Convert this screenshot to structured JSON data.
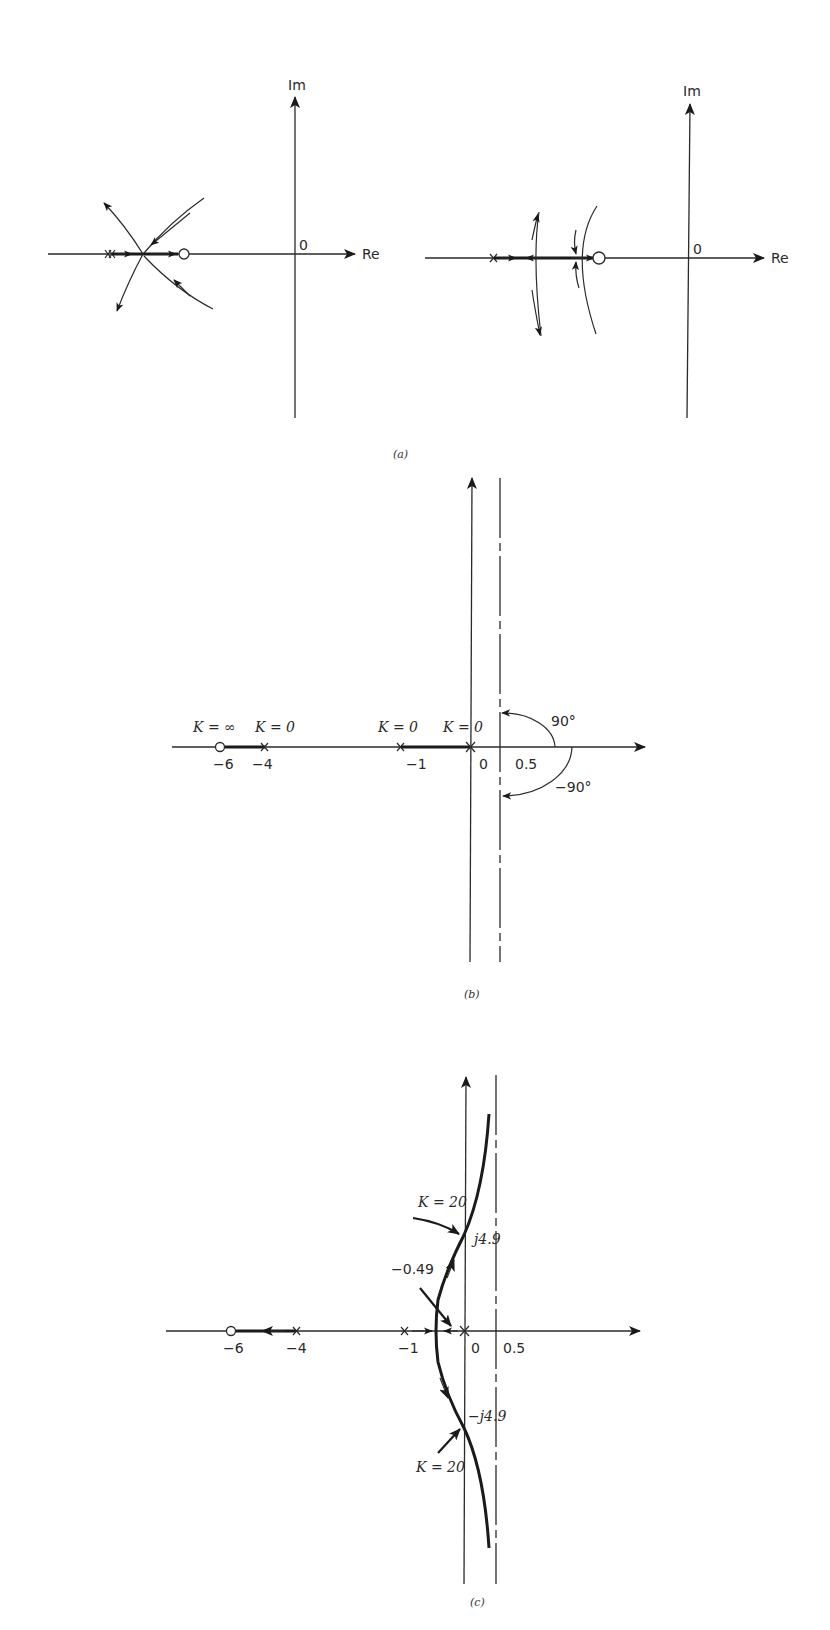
{
  "figure": {
    "panels": [
      {
        "id": "a",
        "caption": "(a)",
        "subplots": [
          {
            "axis_labels": {
              "imag": "Im",
              "real": "Re",
              "origin": "0"
            },
            "description": "Two poles near each other left of a zero; branches meet on real axis then break away as crossing curves"
          },
          {
            "axis_labels": {
              "imag": "Im",
              "real": "Re",
              "origin": "0"
            },
            "description": "Pole, break-away point and break-in point on real axis left of a zero; two arcs"
          }
        ]
      },
      {
        "id": "b",
        "caption": "(b)",
        "annotations": {
          "k_inf": "K = ∞",
          "k0_a": "K = 0",
          "k0_b": "K = 0",
          "k0_c": "K = 0",
          "angle_pos": "90°",
          "angle_neg": "−90°"
        },
        "ticks": [
          "−6",
          "−4",
          "−1",
          "0",
          "0.5"
        ],
        "poles": [
          -4,
          -1,
          0
        ],
        "zeros": [
          -6
        ],
        "asymptote_centroid": 0.5
      },
      {
        "id": "c",
        "caption": "(c)",
        "annotations": {
          "k20_upper": "K = 20",
          "k20_lower": "K = 20",
          "jw_pos": "j4.9",
          "jw_neg": "−j4.9",
          "breakaway": "−0.49"
        },
        "ticks": [
          "−6",
          "−4",
          "−1",
          "0",
          "0.5"
        ],
        "poles": [
          -4,
          -1,
          0
        ],
        "zeros": [
          -6
        ],
        "breakaway_point": -0.49,
        "imag_crossing": 4.9,
        "crossing_gain": 20
      }
    ]
  }
}
